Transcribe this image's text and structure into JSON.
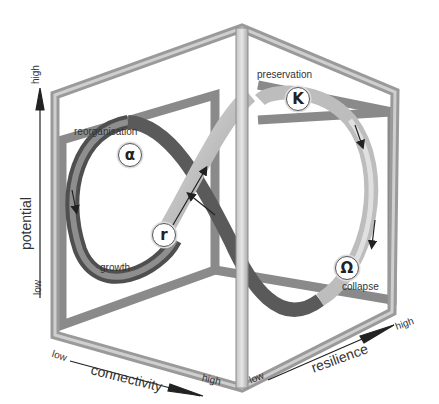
{
  "axes": {
    "potential": {
      "label": "potential",
      "low": "low",
      "high": "high"
    },
    "connectivity": {
      "label": "connectivity",
      "low": "low",
      "high": "high"
    },
    "resilience": {
      "label": "resilience",
      "low": "low",
      "high": "high"
    }
  },
  "phases": [
    {
      "symbol": "α",
      "label": "reorganisation",
      "name": "alpha"
    },
    {
      "symbol": "r",
      "label": "growth",
      "name": "r"
    },
    {
      "symbol": "K",
      "label": "preservation",
      "name": "K"
    },
    {
      "symbol": "Ω",
      "label": "collapse",
      "name": "omega"
    }
  ],
  "colors": {
    "frame_light": "#d4d4d4",
    "frame_mid": "#a8a8a8",
    "frame_dark": "#7a7a7a",
    "ribbon_dark": "#5e5e5e",
    "ribbon_light": "#cfcfcf",
    "text": "#333333"
  }
}
